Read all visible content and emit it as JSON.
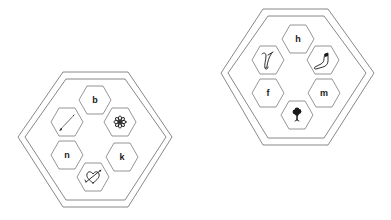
{
  "puzzles": [
    {
      "id": "left",
      "cells": [
        {
          "position": "top",
          "type": "letter",
          "value": "b"
        },
        {
          "position": "upper-left",
          "type": "picture",
          "icon": "pencil-icon"
        },
        {
          "position": "upper-right",
          "type": "picture",
          "icon": "flower-icon"
        },
        {
          "position": "lower-left",
          "type": "letter",
          "value": "n"
        },
        {
          "position": "lower-right",
          "type": "letter",
          "value": "k"
        },
        {
          "position": "bottom",
          "type": "picture",
          "icon": "heart-arrow-icon"
        }
      ]
    },
    {
      "id": "right",
      "cells": [
        {
          "position": "top",
          "type": "letter",
          "value": "h"
        },
        {
          "position": "upper-left",
          "type": "picture",
          "icon": "violin-icon"
        },
        {
          "position": "upper-right",
          "type": "picture",
          "icon": "sock-icon"
        },
        {
          "position": "lower-left",
          "type": "letter",
          "value": "f"
        },
        {
          "position": "lower-right",
          "type": "letter",
          "value": "m"
        },
        {
          "position": "bottom",
          "type": "picture",
          "icon": "tree-icon"
        }
      ]
    }
  ],
  "colors": {
    "stroke": "#6a6a6a",
    "ink": "#1a1a1a",
    "background": "#ffffff"
  }
}
